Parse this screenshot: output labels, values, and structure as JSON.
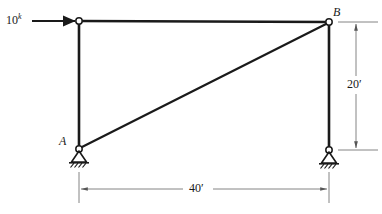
{
  "figure": {
    "type": "structural-frame-diagram",
    "stroke_color": "#1a1a1a",
    "dimension_color": "#8a8a8a",
    "background_color": "#ffffff"
  },
  "load": {
    "magnitude": "10",
    "unit_superscript": "k",
    "direction": "right",
    "applied_at": "top-left-joint"
  },
  "nodes": {
    "a": {
      "label": "A"
    },
    "b": {
      "label": "B"
    }
  },
  "dimensions": {
    "vertical": {
      "value": "20′"
    },
    "horizontal": {
      "value": "40′"
    }
  },
  "geometry": {
    "top_left": {
      "x": 79,
      "y": 21
    },
    "top_right": {
      "x": 329,
      "y": 22
    },
    "bottom_left": {
      "x": 79,
      "y": 149
    },
    "bottom_right": {
      "x": 329,
      "y": 150
    },
    "diagonal": {
      "from": "bottom_left",
      "to": "top_right"
    },
    "joint_radius": 3.2
  },
  "supports": {
    "left": {
      "kind": "pin-support"
    },
    "right": {
      "kind": "pin-support"
    }
  }
}
